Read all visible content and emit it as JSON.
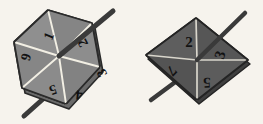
{
  "scene": {
    "title": "Two polygonal spinners with numbered sectors",
    "background_color": "#f6f3ed",
    "width": 263,
    "height": 124
  },
  "spinners": [
    {
      "id": "left-spinner",
      "shape": "hexagon",
      "sector_count": 6,
      "face_color": "#8b8b8b",
      "face_color_dark": "#7c7c7c",
      "outline_color": "#2a2a2a",
      "divider_color": "#f2efe4",
      "axle_color": "#3a3a3a",
      "sectors": [
        {
          "label": "1",
          "cx": 49,
          "cy": 36,
          "rotate": -68
        },
        {
          "label": "2",
          "cx": 83,
          "cy": 43,
          "rotate": -118
        },
        {
          "label": "3",
          "cx": 102,
          "cy": 73,
          "rotate": -118
        },
        {
          "label": "4",
          "cx": 79,
          "cy": 95,
          "rotate": -174
        },
        {
          "label": "5",
          "cx": 53,
          "cy": 90,
          "rotate": -200
        },
        {
          "label": "6",
          "cx": 26,
          "cy": 57,
          "rotate": -255
        }
      ]
    },
    {
      "id": "right-spinner",
      "shape": "rhombus",
      "sector_count": 4,
      "face_color": "#5b5b5b",
      "face_color_dark": "#4f4f4f",
      "outline_color": "#242424",
      "divider_color": "#d9d6cc",
      "axle_color": "#3a3a3a",
      "sectors": [
        {
          "label": "2",
          "cx": 189,
          "cy": 42,
          "rotate": 0
        },
        {
          "label": "3",
          "cx": 220,
          "cy": 55,
          "rotate": -72
        },
        {
          "label": "5",
          "cx": 207,
          "cy": 83,
          "rotate": -182
        },
        {
          "label": "7",
          "cx": 172,
          "cy": 71,
          "rotate": -225
        }
      ]
    }
  ]
}
